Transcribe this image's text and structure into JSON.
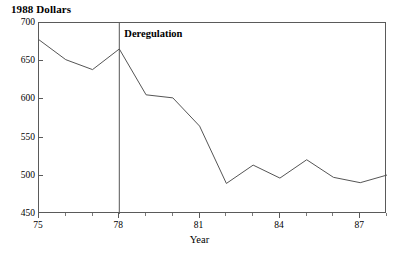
{
  "chart_data": {
    "type": "line",
    "title": "1988 Dollars",
    "xlabel": "Year",
    "ylabel": "",
    "x": [
      75,
      76,
      77,
      78,
      79,
      80,
      81,
      82,
      83,
      84,
      85,
      86,
      87,
      88
    ],
    "values": [
      678,
      652,
      639,
      666,
      606,
      602,
      565,
      490,
      514,
      497,
      521,
      498,
      491,
      501
    ],
    "xlim": [
      75,
      88
    ],
    "ylim": [
      450,
      700
    ],
    "yticks": [
      450,
      500,
      550,
      600,
      650,
      700
    ],
    "ytick_labels": [
      "450",
      "500",
      "550",
      "600",
      "650",
      "700"
    ],
    "xticks": [
      75,
      78,
      81,
      84,
      87
    ],
    "xtick_labels": [
      "75",
      "78",
      "81",
      "84",
      "87"
    ],
    "xminor_ticks": [
      76,
      77,
      79,
      80,
      82,
      83,
      85,
      86,
      88
    ],
    "grid": false,
    "legend": null,
    "line_color": "#555555",
    "axis_color": "#5a5a5a",
    "annotations": [
      {
        "name": "deregulation-marker",
        "label": "Deregulation",
        "x": 78,
        "type": "vertical-line"
      }
    ]
  }
}
